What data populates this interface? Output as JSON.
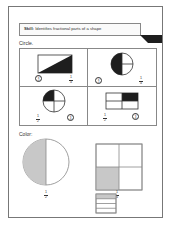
{
  "worksheet": {
    "header": {
      "skill_label": "Skill:",
      "skill_text": "Identifies fractional parts of a shape"
    },
    "ribbon": {
      "label": "Review",
      "number": "1",
      "icon": "pencil-icon"
    },
    "circle_section": {
      "instruction": "Circle.",
      "problems": [
        {
          "shape": "rectangle-diagonal-half",
          "shaded_fraction": "1/2",
          "options": [
            {
              "num": "1",
              "den": "2",
              "circled": true
            },
            {
              "num": "1",
              "den": "4",
              "circled": false
            }
          ]
        },
        {
          "shape": "circle-halves-quarters",
          "shaded_fraction": "1/2",
          "options": [
            {
              "num": "1",
              "den": "2",
              "circled": true
            },
            {
              "num": "1",
              "den": "4",
              "circled": false
            }
          ]
        },
        {
          "shape": "circle-quarters",
          "shaded_fraction": "1/4",
          "options": [
            {
              "num": "1",
              "den": "2",
              "circled": false
            },
            {
              "num": "1",
              "den": "4",
              "circled": true
            }
          ]
        },
        {
          "shape": "rectangle-quarters",
          "shaded_fraction": "1/4",
          "options": [
            {
              "num": "1",
              "den": "2",
              "circled": false
            },
            {
              "num": "1",
              "den": "4",
              "circled": true
            }
          ]
        }
      ]
    },
    "color_section": {
      "instruction": "Color:",
      "items": [
        {
          "shape": "circle-halves",
          "fraction": {
            "num": "1",
            "den": "2"
          },
          "shaded": "left-half"
        },
        {
          "shape": "square-quarters",
          "fraction": {
            "num": "1",
            "den": "4"
          },
          "shaded": "bottom-left"
        },
        {
          "shape": "rectangle-stripes",
          "stripes": 4,
          "shaded": "top-stripe"
        }
      ]
    },
    "colors": {
      "ink": "#1e1e1e",
      "shade": "#c8c8c8",
      "border": "#888888"
    }
  }
}
